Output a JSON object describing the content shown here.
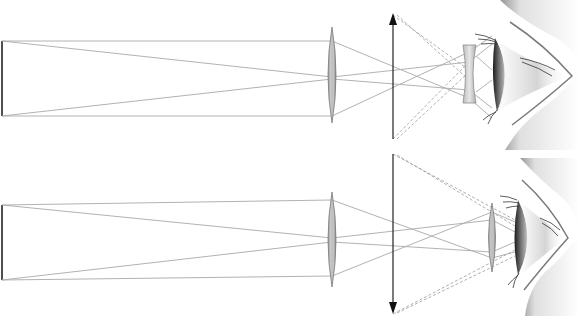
{
  "diagram": {
    "colors": {
      "background": "#ffffff",
      "ray": "#a9a9a9",
      "ray_dashed": "#9a9a9a",
      "arrow": "#222222",
      "lens_fill": "#c8c8c8",
      "lens_stroke": "#7a7a7a",
      "skin_shadow": "#5a5a5a"
    },
    "panels": [
      {
        "id": "top",
        "type": "galilean-telescope",
        "object": {
          "x": 2,
          "y_top": 41,
          "y_bottom": 116
        },
        "objective_lens": {
          "kind": "convex",
          "x": 332,
          "y_top": 27,
          "y_bottom": 123
        },
        "intermediate_image": {
          "x": 393,
          "y_tip": 13,
          "y_base": 139,
          "direction": "up"
        },
        "eyepiece_lens": {
          "kind": "concave",
          "x": 469,
          "y_top": 45,
          "y_bottom": 103
        },
        "eye": {
          "x": 492,
          "y_center": 74
        }
      },
      {
        "id": "bottom",
        "type": "keplerian-telescope",
        "object": {
          "x": 2,
          "y_top": 205,
          "y_bottom": 280
        },
        "objective_lens": {
          "kind": "convex",
          "x": 332,
          "y_top": 192,
          "y_bottom": 287
        },
        "intermediate_image": {
          "x": 393,
          "y_tip": 314,
          "y_base": 154,
          "direction": "down"
        },
        "eyepiece_lens": {
          "kind": "convex",
          "x": 492,
          "y_top": 203,
          "y_bottom": 272
        },
        "eye": {
          "x": 515,
          "y_center": 237
        }
      }
    ]
  }
}
